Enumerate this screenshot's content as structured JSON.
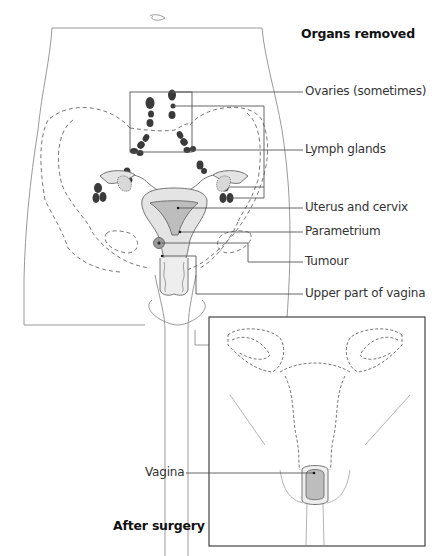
{
  "diagram": {
    "title": "Organs removed",
    "labels": [
      {
        "id": "ovaries",
        "text": "Ovaries (sometimes)"
      },
      {
        "id": "lymph",
        "text": "Lymph glands"
      },
      {
        "id": "uterus",
        "text": "Uterus and cervix"
      },
      {
        "id": "parametrium",
        "text": "Parametrium"
      },
      {
        "id": "tumour",
        "text": "Tumour"
      },
      {
        "id": "vagina-upper",
        "text": "Upper part of vagina"
      }
    ],
    "inset": {
      "title": "After surgery",
      "label": "Vagina"
    },
    "colors": {
      "outline": "#8a8a8a",
      "dashed": "#777777",
      "lymph_node": "#3a3a3a",
      "organ_fill": "#e4e4e4",
      "organ_dark": "#bdbdbd",
      "leader": "#555555"
    }
  }
}
